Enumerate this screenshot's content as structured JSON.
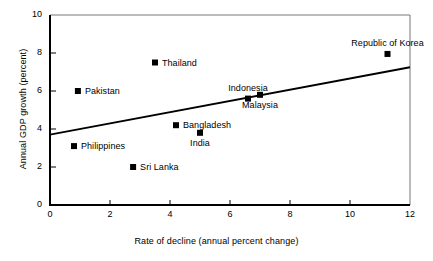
{
  "chart_data": {
    "type": "scatter",
    "title": "",
    "xlabel": "Rate of decline (annual percent change)",
    "ylabel": "Annual GDP growth (percent)",
    "xlim": [
      0,
      12
    ],
    "ylim": [
      0,
      10
    ],
    "xticks": [
      "0",
      "2",
      "4",
      "6",
      "8",
      "10",
      "12"
    ],
    "yticks": [
      "0",
      "2",
      "4",
      "6",
      "8",
      "10"
    ],
    "grid": false,
    "legend": "none",
    "marker_style": "filled-square",
    "points": [
      {
        "label": "Pakistan",
        "x": 0.93,
        "y": 6.0,
        "label_pos": "right"
      },
      {
        "label": "Philippines",
        "x": 0.8,
        "y": 3.1,
        "label_pos": "right"
      },
      {
        "label": "Sri Lanka",
        "x": 2.77,
        "y": 2.0,
        "label_pos": "right"
      },
      {
        "label": "Thailand",
        "x": 3.5,
        "y": 7.5,
        "label_pos": "right"
      },
      {
        "label": "Bangladesh",
        "x": 4.2,
        "y": 4.2,
        "label_pos": "right"
      },
      {
        "label": "India",
        "x": 5.0,
        "y": 3.8,
        "label_pos": "below"
      },
      {
        "label": "Indonesia",
        "x": 6.6,
        "y": 5.6,
        "label_pos": "above"
      },
      {
        "label": "Malaysia",
        "x": 7.0,
        "y": 5.8,
        "label_pos": "below"
      },
      {
        "label": "Republic of Korea",
        "x": 11.25,
        "y": 7.95,
        "label_pos": "above"
      }
    ],
    "trendline": {
      "type": "line",
      "x": [
        0,
        12
      ],
      "y": [
        3.7,
        7.25
      ]
    },
    "colors": {
      "marker": "#000000",
      "axis": "#000000",
      "trendline": "#000000",
      "background": "#ffffff"
    }
  }
}
